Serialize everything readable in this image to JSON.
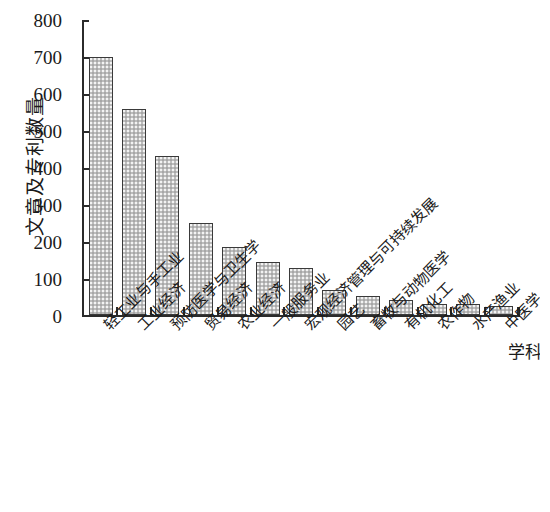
{
  "chart_data": {
    "type": "bar",
    "title": "",
    "xlabel": "学科",
    "ylabel": "文章及专利数量",
    "ylim": [
      0,
      800
    ],
    "ytick_labels": [
      "800",
      "700",
      "600",
      "500",
      "400",
      "300",
      "200",
      "100",
      "0"
    ],
    "ytick_values": [
      800,
      700,
      600,
      500,
      400,
      300,
      200,
      100,
      0
    ],
    "grid": false,
    "legend": null,
    "bar_color": "#bdbdbd",
    "bar_edge_color": "#3a3a3a",
    "categories": [
      "轻工业与手工业",
      "工业经济",
      "预防医学与卫生学",
      "贸易经济",
      "农业经济",
      "一般服务业",
      "宏观经济管理与可持续发展",
      "园艺",
      "畜牧与动物医学",
      "有机化工",
      "农作物",
      "水产渔业",
      "中医学"
    ],
    "values": [
      700,
      558,
      432,
      250,
      185,
      143,
      128,
      68,
      52,
      40,
      30,
      30,
      25
    ]
  },
  "neighbor_figure": {
    "partial_ylabel": "文章及专利数量"
  }
}
